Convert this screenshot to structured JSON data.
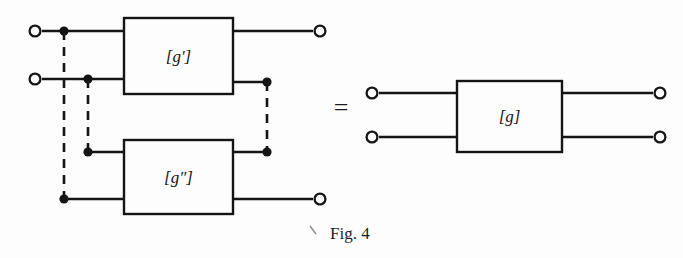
{
  "figure": {
    "caption": "Fig. 4",
    "equality_symbol": "=",
    "background_color": "#fdfdfd",
    "line_color": "#151515"
  },
  "left_network": {
    "blocks": [
      {
        "id": "g-prime",
        "label": "[g′]",
        "x": 124,
        "y": 18,
        "width": 109,
        "height": 76
      },
      {
        "id": "g-double-prime",
        "label": "[g″]",
        "x": 124,
        "y": 140,
        "width": 109,
        "height": 74
      }
    ],
    "terminals": [
      {
        "id": "in-top",
        "label": "",
        "cx": 35,
        "cy": 31,
        "side": "left"
      },
      {
        "id": "in-bottom",
        "label": "",
        "cx": 35,
        "cy": 79,
        "side": "left"
      },
      {
        "id": "out-top",
        "label": "",
        "cx": 320,
        "cy": 31,
        "side": "right"
      },
      {
        "id": "out-bottom",
        "label": "",
        "cx": 320,
        "cy": 199,
        "side": "right"
      }
    ],
    "junction_dots": [
      {
        "id": "dot-in-top",
        "cx": 64,
        "cy": 31
      },
      {
        "id": "dot-in-bottom",
        "cx": 88,
        "cy": 79
      },
      {
        "id": "dot-lower-in",
        "cx": 88,
        "cy": 152
      },
      {
        "id": "dot-lower-bottom",
        "cx": 64,
        "cy": 199
      },
      {
        "id": "dot-out-upper",
        "cx": 267,
        "cy": 82
      },
      {
        "id": "dot-out-lower",
        "cx": 267,
        "cy": 152
      }
    ],
    "dashed_connections": [
      {
        "id": "dash-left-outer",
        "x1": 64,
        "y1": 31,
        "x2": 64,
        "y2": 199
      },
      {
        "id": "dash-left-inner",
        "x1": 88,
        "y1": 79,
        "x2": 88,
        "y2": 152
      },
      {
        "id": "dash-right",
        "x1": 267,
        "y1": 82,
        "x2": 267,
        "y2": 152
      }
    ]
  },
  "right_network": {
    "blocks": [
      {
        "id": "g-combined",
        "label": "[g]",
        "x": 457,
        "y": 81,
        "width": 105,
        "height": 71
      }
    ],
    "terminals": [
      {
        "id": "r-in-top",
        "label": "",
        "cx": 372,
        "cy": 93,
        "side": "left"
      },
      {
        "id": "r-in-bottom",
        "label": "",
        "cx": 372,
        "cy": 137,
        "side": "left"
      },
      {
        "id": "r-out-top",
        "label": "",
        "cx": 660,
        "cy": 93,
        "side": "right"
      },
      {
        "id": "r-out-bottom",
        "label": "",
        "cx": 660,
        "cy": 137,
        "side": "right"
      }
    ]
  }
}
